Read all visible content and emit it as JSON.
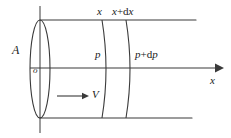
{
  "figure": {
    "type": "physics-diagram",
    "background_color": "#ffffff",
    "line_color": "#3a3a3a",
    "text_color": "#1a1a1a"
  },
  "labels": {
    "x_top": "x",
    "x_plus_dx_top_base": "x",
    "x_plus_dx_top_operator": "+",
    "x_plus_dx_top_diff": "d",
    "x_plus_dx_top_var": "x",
    "area": "A",
    "pressure": "p",
    "pressure_plus_dp_base": "p",
    "pressure_plus_dp_operator": "+",
    "pressure_plus_dp_diff": "d",
    "pressure_plus_dp_var": "p",
    "origin": "o",
    "axis_x": "x",
    "velocity": "V"
  },
  "geometry": {
    "axis_y": 68,
    "top_wall_y": 20,
    "bottom_wall_y": 118,
    "left_face_center_x": 40,
    "left_face_rx": 10,
    "left_face_ry": 49,
    "section_x_arc_x": 105,
    "section_xdx_arc_x": 128,
    "axis_arrow_tip_x": 220,
    "top_wall_end_x": 196,
    "bottom_wall_end_x": 192,
    "velocity_arrow_start_x": 57,
    "velocity_arrow_end_x": 86,
    "velocity_arrow_y": 96
  }
}
